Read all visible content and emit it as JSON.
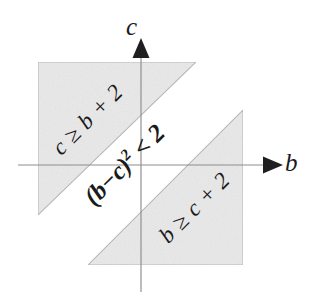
{
  "figure": {
    "type": "inequality-region-diagram",
    "background_color": "#ffffff",
    "ink_color": "#1a1a1a",
    "axis_color": "#8a8a8a",
    "region_fill_color": "#e8e8e8",
    "region_stroke_color": "#b5b5b5"
  },
  "axes": {
    "horizontal": {
      "label": "b",
      "arrow": "arrow-right",
      "y": 165,
      "x_start": 18,
      "x_end": 265
    },
    "vertical": {
      "label": "c",
      "arrow": "arrow-up",
      "x": 141,
      "y_start": 35,
      "y_end": 292
    }
  },
  "regions": [
    {
      "name": "upper-left-region",
      "label": "c ≥ b + 2",
      "shape": "right-triangle",
      "vertices": "38,62 196,62 38,215",
      "label_rotation_deg": -45
    },
    {
      "name": "lower-right-region",
      "label": "b ≥ c + 2",
      "shape": "right-triangle",
      "vertices": "243,110 243,265 88,265",
      "label_rotation_deg": -45
    }
  ],
  "band": {
    "name": "central-band",
    "expression_base": "(b−c)",
    "expression_exponent": "2",
    "expression_tail": " < 2",
    "label_rotation_deg": -45
  }
}
